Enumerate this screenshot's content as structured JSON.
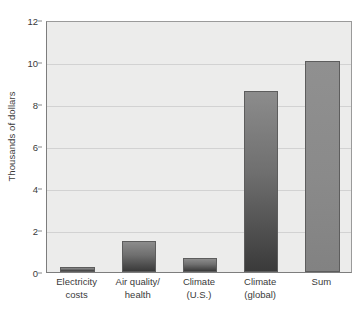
{
  "chart_data": {
    "type": "bar",
    "title": "",
    "xlabel": "",
    "ylabel": "Thousands of dollars",
    "categories": [
      "Electricity costs",
      "Air quality/ health",
      "Climate (U.S.)",
      "Climate (global)",
      "Sum"
    ],
    "category_lines": [
      [
        "Electricity",
        "costs"
      ],
      [
        "Air quality/",
        "health"
      ],
      [
        "Climate",
        "(U.S.)"
      ],
      [
        "Climate",
        "(global)"
      ],
      [
        "Sum",
        ""
      ]
    ],
    "values": [
      0.25,
      1.5,
      0.65,
      8.6,
      10.05
    ],
    "ylim": [
      0,
      12
    ],
    "yticks": [
      0,
      2,
      4,
      6,
      8,
      10,
      12
    ],
    "ytick_labels": [
      "0",
      "2",
      "4",
      "6",
      "8",
      "10",
      "12"
    ],
    "grid": true,
    "legend": "none",
    "bar_styles": [
      "gradient-dark",
      "gradient-dark",
      "gradient-dark",
      "gradient-dark",
      "flat-gray"
    ]
  },
  "style": {
    "plot_background": "#ececeb",
    "gridline_color": "#d2d2d2",
    "axis_color": "#7d7d7d",
    "text_color": "#3a3a3a",
    "bar_top_color": "#8c8c8c",
    "bar_bottom_color": "#3a3a3a",
    "bar_flat_color": "#888888",
    "bar_outline": "#5d5d5d"
  }
}
